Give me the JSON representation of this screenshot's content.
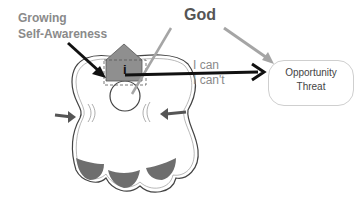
{
  "labels": {
    "growing_line1": "Growing",
    "growing_line2": "Self-Awareness",
    "god": "God",
    "i_can": "I can",
    "i_cant": "I can't",
    "box_line1": "Opportunity",
    "box_line2": "Threat",
    "house_letter": "i"
  },
  "colors": {
    "label_gray": "#8a8a8a",
    "god_text": "#555555",
    "arrow_black": "#111111",
    "arrow_gray": "#a5a5a5",
    "house_fill": "#8f8f8f",
    "lobe_fill": "#6e6e6e"
  }
}
